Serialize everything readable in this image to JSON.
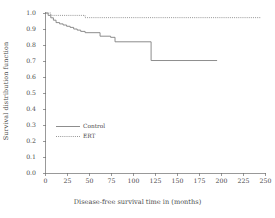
{
  "chart_data": {
    "type": "line",
    "subtype": "step-kaplan-meier",
    "title": "",
    "xlabel": "Disease-free survival time in  (months)",
    "ylabel": "Survival distribution function",
    "xlim": [
      0,
      250
    ],
    "ylim": [
      0.0,
      1.0
    ],
    "xticks": [
      0,
      25,
      50,
      75,
      100,
      125,
      150,
      175,
      200,
      225,
      250
    ],
    "xtick_labels": [
      "0",
      "25",
      "50",
      "75",
      "100",
      "125",
      "150",
      "175",
      "200",
      "225",
      "250"
    ],
    "yticks": [
      0.0,
      0.1,
      0.2,
      0.3,
      0.4,
      0.5,
      0.6,
      0.7,
      0.8,
      0.9,
      1.0
    ],
    "ytick_labels": [
      "0.0",
      "0.1",
      "0.2",
      "0.3",
      "0.4",
      "0.5",
      "0.6",
      "0.7",
      "0.8",
      "0.9",
      "1.0"
    ],
    "grid": false,
    "legend_position": "center-left",
    "series": [
      {
        "name": "Control",
        "linestyle": "solid",
        "color": "#808080",
        "x": [
          0,
          3,
          3,
          6,
          6,
          9,
          9,
          12,
          12,
          16,
          16,
          20,
          20,
          24,
          24,
          28,
          28,
          32,
          32,
          36,
          36,
          40,
          40,
          45,
          45,
          62,
          62,
          74,
          74,
          79,
          79,
          120,
          120,
          195
        ],
        "y": [
          1.0,
          1.0,
          0.985,
          0.985,
          0.97,
          0.97,
          0.955,
          0.955,
          0.94,
          0.94,
          0.932,
          0.932,
          0.925,
          0.925,
          0.917,
          0.917,
          0.91,
          0.91,
          0.9,
          0.9,
          0.893,
          0.893,
          0.885,
          0.885,
          0.877,
          0.877,
          0.855,
          0.855,
          0.848,
          0.848,
          0.82,
          0.82,
          0.703,
          0.703
        ]
      },
      {
        "name": "ERT",
        "linestyle": "dotted",
        "color": "#8a8a8a",
        "x": [
          0,
          6,
          6,
          45,
          45,
          245
        ],
        "y": [
          1.0,
          1.0,
          0.985,
          0.985,
          0.971,
          0.971
        ]
      }
    ]
  },
  "legend": {
    "entries": [
      {
        "label": "Control",
        "linestyle": "solid"
      },
      {
        "label": "ERT",
        "linestyle": "dotted"
      }
    ]
  },
  "colors": {
    "axis": "#6e6e6e",
    "control_line": "#808080",
    "ert_line": "#8a8a8a",
    "text": "#4a4a4a",
    "background": "#ffffff"
  }
}
